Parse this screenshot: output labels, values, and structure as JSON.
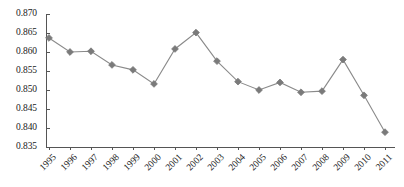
{
  "chart_data": {
    "type": "line",
    "title": "",
    "xlabel": "",
    "ylabel": "",
    "categories": [
      "1995",
      "1996",
      "1997",
      "1998",
      "1999",
      "2000",
      "2001",
      "2002",
      "2003",
      "2004",
      "2005",
      "2006",
      "2007",
      "2008",
      "2009",
      "2010",
      "2011"
    ],
    "values": [
      0.8637,
      0.86,
      0.8602,
      0.8566,
      0.8553,
      0.8516,
      0.8608,
      0.8651,
      0.8576,
      0.8522,
      0.85,
      0.852,
      0.8494,
      0.8497,
      0.858,
      0.8486,
      0.8389
    ],
    "ylim": [
      0.835,
      0.87
    ],
    "ytick_values": [
      0.835,
      0.84,
      0.845,
      0.85,
      0.855,
      0.86,
      0.865,
      0.87
    ],
    "ytick_labels": [
      "0.835",
      "0.840",
      "0.845",
      "0.850",
      "0.855",
      "0.860",
      "0.865",
      "0.870"
    ],
    "grid": false,
    "legend": null,
    "series_color": "#7a7a7a",
    "line_color": "#8a8a8a",
    "axis_color": "#555555",
    "marker": "diamond",
    "xtick_rotation": -45
  }
}
